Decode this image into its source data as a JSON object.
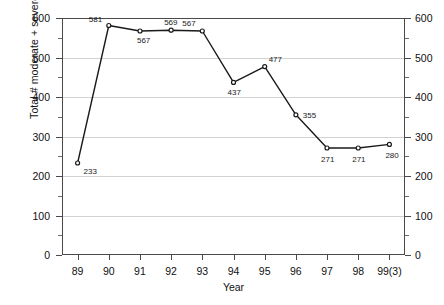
{
  "chart_data": {
    "type": "line",
    "title": "",
    "xlabel": "Year",
    "ylabel": "Total # moderate + severe ADEs",
    "categories": [
      "89",
      "90",
      "91",
      "92",
      "93",
      "94",
      "95",
      "96",
      "97",
      "98",
      "99(3)"
    ],
    "values": [
      233,
      581,
      567,
      569,
      567,
      437,
      477,
      355,
      271,
      271,
      280
    ],
    "series": [
      {
        "name": "Total # moderate + severe ADEs",
        "values": [
          233,
          581,
          567,
          569,
          567,
          437,
          477,
          355,
          271,
          271,
          280
        ]
      }
    ],
    "point_labels": [
      "233",
      "581",
      "567",
      "569",
      "567",
      "437",
      "477",
      "355",
      "271",
      "271",
      "280"
    ],
    "ylim": [
      0,
      600
    ],
    "y_ticks_major": [
      "0",
      "100",
      "200",
      "300",
      "400",
      "500",
      "600"
    ],
    "y_ticks_minor": [
      "50",
      "150",
      "250",
      "350",
      "450",
      "550"
    ],
    "right_axis": {
      "visible": true,
      "ylim": [
        0,
        600
      ],
      "ticks": [
        "0",
        "100",
        "200",
        "300",
        "400",
        "500",
        "600"
      ]
    },
    "grid": "horizontal-major-only",
    "legend": "none",
    "marker": "open-circle",
    "line_color": "#1a1a1a",
    "grid_color": "#d2d2d2",
    "frame_color": "#4a4a4a"
  }
}
